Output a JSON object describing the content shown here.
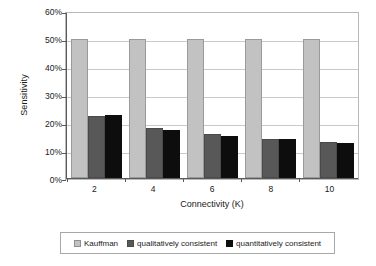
{
  "chart_data": {
    "type": "bar",
    "title": "",
    "xlabel": "Connectivity (K)",
    "ylabel": "Sensitivity",
    "categories": [
      "2",
      "4",
      "6",
      "8",
      "10"
    ],
    "series": [
      {
        "name": "Kauffman",
        "color": "#c2c2c2",
        "values": [
          50.0,
          50.0,
          50.0,
          50.0,
          50.0
        ]
      },
      {
        "name": "qualitatively consistent",
        "color": "#585858",
        "values": [
          22.2,
          17.8,
          15.7,
          14.0,
          12.9
        ]
      },
      {
        "name": "quantitatively consistent",
        "color": "#0d0d0d",
        "values": [
          22.7,
          17.4,
          15.2,
          14.1,
          12.5
        ]
      }
    ],
    "ylim": [
      0,
      60
    ],
    "ytick_labels": [
      "0%",
      "10%",
      "20%",
      "30%",
      "40%",
      "50%",
      "60%"
    ],
    "ytick_values": [
      0,
      10,
      20,
      30,
      40,
      50,
      60
    ],
    "grid": "horizontal",
    "legend_position": "bottom"
  },
  "legend": {
    "items": [
      {
        "label": "Kauffman"
      },
      {
        "label": "qualitatively consistent"
      },
      {
        "label": "quantitatively consistent"
      }
    ]
  }
}
